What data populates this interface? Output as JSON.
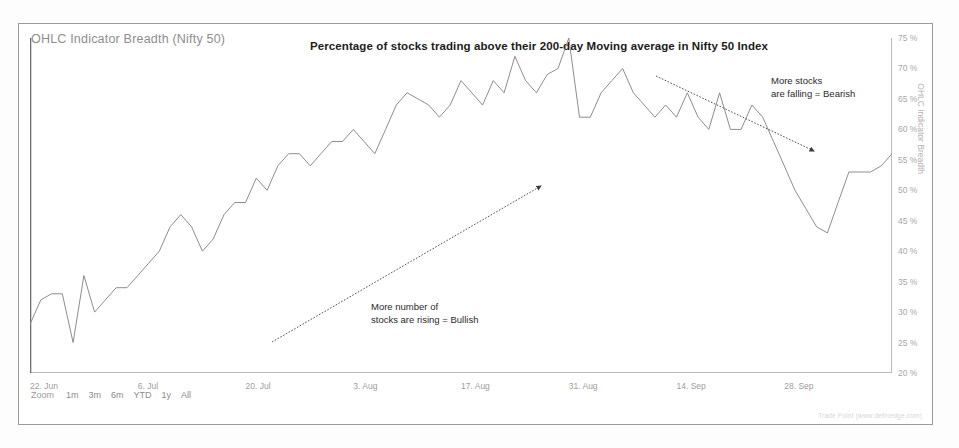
{
  "widget": {
    "title": "OHLC Indicator Breadth (Nifty 50)",
    "credit": "Trade Point (www.definedge.com)"
  },
  "range_selector": {
    "label": "Zoom",
    "options": [
      "1m",
      "3m",
      "6m",
      "YTD",
      "1y",
      "All"
    ]
  },
  "annotations": [
    {
      "name": "bullish",
      "line1": "More number of",
      "line2": "stocks are rising = Bullish"
    },
    {
      "name": "bearish",
      "line1": "More stocks",
      "line2": "are falling = Bearish"
    }
  ],
  "chart_data": {
    "type": "line",
    "title": "Percentage of stocks trading above their 200-day Moving average in Nifty 50 Index",
    "xlabel": "",
    "ylabel": "OHLC Indicator Breadth",
    "ylim": [
      20,
      75
    ],
    "y_axis_position": "right",
    "grid": false,
    "legend_position": "none",
    "line_color": "#8d8d8d",
    "y_ticks": [
      "20 %",
      "25 %",
      "30 %",
      "35 %",
      "40 %",
      "45 %",
      "50 %",
      "55 %",
      "60 %",
      "65 %",
      "70 %",
      "75 %"
    ],
    "y_tick_values": [
      20,
      25,
      30,
      35,
      40,
      45,
      50,
      55,
      60,
      65,
      70,
      75
    ],
    "x_ticks": [
      "22. Jun",
      "6. Jul",
      "20. Jul",
      "3. Aug",
      "17. Aug",
      "31. Aug",
      "14. Sep",
      "28. Sep"
    ],
    "x_tick_index": [
      0,
      10,
      20,
      30,
      40,
      50,
      60,
      70
    ],
    "series": [
      {
        "name": "OHLC Indicator Breadth",
        "values": [
          28,
          32,
          33,
          33,
          25,
          36,
          30,
          32,
          34,
          34,
          36,
          38,
          40,
          44,
          46,
          44,
          40,
          42,
          46,
          48,
          48,
          52,
          50,
          54,
          56,
          56,
          54,
          56,
          58,
          58,
          60,
          58,
          56,
          60,
          64,
          66,
          65,
          64,
          62,
          64,
          68,
          66,
          64,
          68,
          66,
          72,
          68,
          66,
          69,
          70,
          75,
          62,
          62,
          66,
          68,
          70,
          66,
          64,
          62,
          64,
          62,
          66,
          62,
          60,
          66,
          60,
          60,
          64,
          62,
          58,
          54,
          50,
          47,
          44,
          43,
          48,
          53,
          53,
          53,
          54,
          56
        ]
      }
    ],
    "arrows": [
      {
        "name": "bullish-trend-arrow",
        "x1": 253,
        "y1": 318,
        "x2": 522,
        "y2": 162
      },
      {
        "name": "bearish-trend-arrow",
        "x1": 637,
        "y1": 52,
        "x2": 795,
        "y2": 127
      }
    ]
  }
}
